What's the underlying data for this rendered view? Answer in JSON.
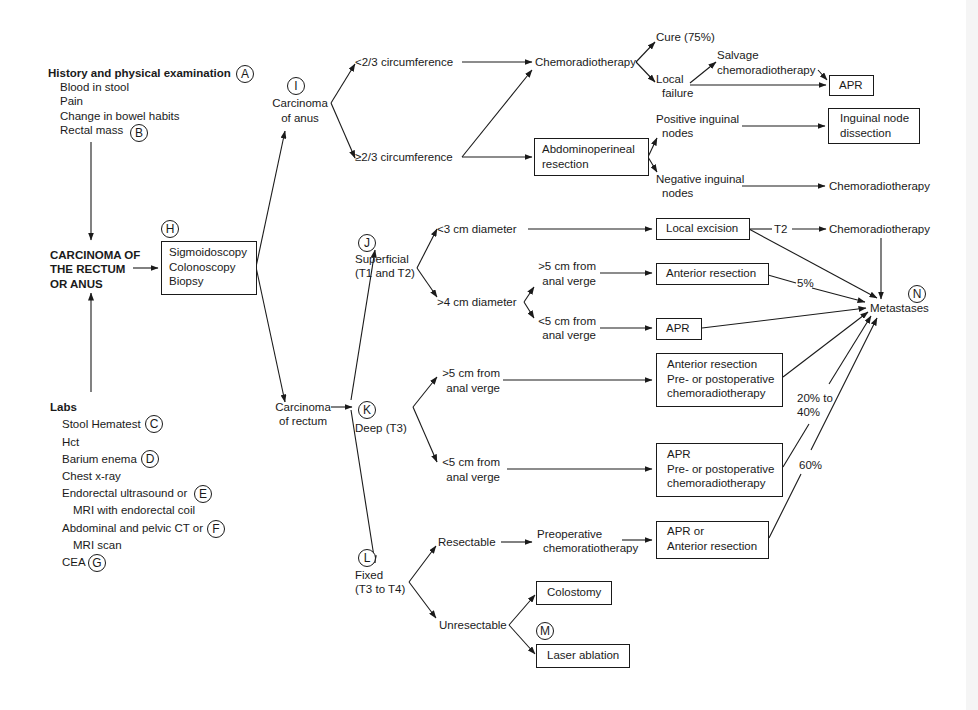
{
  "diagram": {
    "type": "clinical-algorithm-flowchart",
    "history": {
      "title": "History and physical examination",
      "marker": "A",
      "items": [
        "Blood in stool",
        "Pain",
        "Change in bowel habits",
        "Rectal mass"
      ],
      "rectal_mass_marker": "B"
    },
    "labs": {
      "title": "Labs",
      "items": [
        {
          "label": "Stool Hematest",
          "marker": "C"
        },
        {
          "label": "Hct"
        },
        {
          "label": "Barium enema",
          "marker": "D"
        },
        {
          "label": "Chest x-ray"
        },
        {
          "label": "Endorectal ultrasound or",
          "marker": "E"
        },
        {
          "label": "MRI with endorectal coil"
        },
        {
          "label": "Abdominal and pelvic CT or",
          "marker": "F"
        },
        {
          "label": "MRI scan"
        },
        {
          "label": "CEA",
          "marker": "G"
        }
      ]
    },
    "root": {
      "lines": [
        "CARCINOMA OF",
        "THE RECTUM",
        "OR ANUS"
      ]
    },
    "workup": {
      "marker": "H",
      "lines": [
        "Sigmoidoscopy",
        "Colonoscopy",
        "Biopsy"
      ]
    },
    "anus": {
      "marker": "I",
      "lines": [
        "Carcinoma",
        "of anus"
      ],
      "lt_two_thirds": "<2/3 circumference",
      "ge_two_thirds": "≥2/3 circumference",
      "chemoradiotherapy": "Chemoradiotherapy",
      "cure": "Cure (75%)",
      "local_failure": [
        "Local",
        "failure"
      ],
      "salvage": [
        "Salvage",
        "chemoradiotherapy"
      ],
      "apr": "APR",
      "apr_resection": [
        "Abdominoperineal",
        "resection"
      ],
      "positive_nodes": [
        "Positive inguinal",
        "nodes"
      ],
      "negative_nodes": [
        "Negative inguinal",
        "nodes"
      ],
      "node_dissection": [
        "Inguinal node",
        "dissection"
      ],
      "neg_chemoradiotherapy": "Chemoradiotherapy"
    },
    "rectum": {
      "lines": [
        "Carcinoma",
        "of rectum"
      ],
      "superficial": {
        "marker": "J",
        "lines": [
          "Superficial",
          "(T1 and T2)"
        ],
        "lt3": "<3 cm diameter",
        "gt4": ">4 cm diameter",
        "gt5": [
          ">5 cm from",
          "anal verge"
        ],
        "lt5": [
          "<5 cm from",
          "anal verge"
        ],
        "local_excision": "Local excision",
        "t2": "T2",
        "chemoradiotherapy": "Chemoradiotherapy",
        "anterior_resection": "Anterior resection",
        "apr": "APR",
        "pct_5": "5%"
      },
      "deep": {
        "marker": "K",
        "label": "Deep (T3)",
        "gt5": [
          ">5 cm from",
          "anal verge"
        ],
        "lt5": [
          "<5 cm from",
          "anal verge"
        ],
        "ar_box": [
          "Anterior resection",
          "Pre- or postoperative",
          "chemoradiotherapy"
        ],
        "apr_box": [
          "APR",
          "Pre- or postoperative",
          "chemoradiotherapy"
        ],
        "pct_20_40": [
          "20% to",
          "40%"
        ],
        "pct_60": "60%"
      },
      "fixed": {
        "marker": "L",
        "lines": [
          "Fixed",
          "(T3 to T4)"
        ],
        "resectable": "Resectable",
        "preop": [
          "Preoperative",
          "chemoratiotherapy"
        ],
        "apr_or_ar": [
          "APR or",
          "Anterior resection"
        ],
        "unresectable": "Unresectable",
        "colostomy": "Colostomy",
        "laser_marker": "M",
        "laser": "Laser ablation"
      }
    },
    "metastases": {
      "marker": "N",
      "label": "Metastases"
    }
  }
}
